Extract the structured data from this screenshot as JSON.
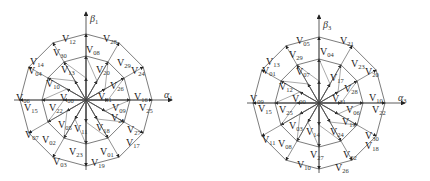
{
  "figure": {
    "panels": [
      {
        "id": "alpha1-beta1",
        "axes": {
          "x_label": "α",
          "x_sub": "1",
          "y_label": "β",
          "y_sub": "1"
        },
        "center": [
          86,
          100
        ],
        "ring_radii": [
          22,
          44,
          66
        ],
        "vectors": [
          {
            "name": "V",
            "sub": "12",
            "x": 62,
            "y": 34
          },
          {
            "name": "V",
            "sub": "28",
            "x": 103,
            "y": 34
          },
          {
            "name": "V",
            "sub": "30",
            "x": 53,
            "y": 48
          },
          {
            "name": "V",
            "sub": "08",
            "x": 86,
            "y": 45
          },
          {
            "name": "V",
            "sub": "14",
            "x": 30,
            "y": 57
          },
          {
            "name": "V",
            "sub": "29",
            "x": 117,
            "y": 58
          },
          {
            "name": "V",
            "sub": "24",
            "x": 131,
            "y": 66
          },
          {
            "name": "V",
            "sub": "04",
            "x": 28,
            "y": 66
          },
          {
            "name": "V",
            "sub": "13",
            "x": 61,
            "y": 65
          },
          {
            "name": "V",
            "sub": "20",
            "x": 96,
            "y": 65
          },
          {
            "name": "V",
            "sub": "10",
            "x": 46,
            "y": 79
          },
          {
            "name": "V",
            "sub": "26",
            "x": 110,
            "y": 81
          },
          {
            "name": "V",
            "sub": "06",
            "x": 16,
            "y": 93
          },
          {
            "name": "V",
            "sub": "00",
            "x": 60,
            "y": 93
          },
          {
            "name": "V",
            "sub": "31",
            "x": 98,
            "y": 92
          },
          {
            "name": "V",
            "sub": "16",
            "x": 134,
            "y": 92
          },
          {
            "name": "V",
            "sub": "15",
            "x": 24,
            "y": 103
          },
          {
            "name": "V",
            "sub": "22",
            "x": 49,
            "y": 103
          },
          {
            "name": "V",
            "sub": "09",
            "x": 112,
            "y": 103
          },
          {
            "name": "V",
            "sub": "25",
            "x": 139,
            "y": 103
          },
          {
            "name": "V",
            "sub": "21",
            "x": 111,
            "y": 113
          },
          {
            "name": "V",
            "sub": "05",
            "x": 58,
            "y": 120
          },
          {
            "name": "V",
            "sub": "11",
            "x": 74,
            "y": 124
          },
          {
            "name": "V",
            "sub": "18",
            "x": 96,
            "y": 123
          },
          {
            "name": "V",
            "sub": "27",
            "x": 127,
            "y": 125
          },
          {
            "name": "V",
            "sub": "07",
            "x": 25,
            "y": 130
          },
          {
            "name": "V",
            "sub": "02",
            "x": 42,
            "y": 135
          },
          {
            "name": "V",
            "sub": "17",
            "x": 126,
            "y": 138
          },
          {
            "name": "V",
            "sub": "23",
            "x": 69,
            "y": 147
          },
          {
            "name": "V",
            "sub": "01",
            "x": 100,
            "y": 147
          },
          {
            "name": "V",
            "sub": "03",
            "x": 53,
            "y": 157
          },
          {
            "name": "V",
            "sub": "19",
            "x": 91,
            "y": 158
          }
        ]
      },
      {
        "id": "alpha3-beta3",
        "axes": {
          "x_label": "α",
          "x_sub": "3",
          "y_label": "β",
          "y_sub": "3"
        },
        "center": [
          104,
          103
        ],
        "ring_radii": [
          22,
          44,
          66
        ],
        "vectors": [
          {
            "name": "V",
            "sub": "05",
            "x": 81,
            "y": 36
          },
          {
            "name": "V",
            "sub": "21",
            "x": 125,
            "y": 36
          },
          {
            "name": "V",
            "sub": "29",
            "x": 74,
            "y": 50
          },
          {
            "name": "V",
            "sub": "04",
            "x": 105,
            "y": 47
          },
          {
            "name": "V",
            "sub": "13",
            "x": 51,
            "y": 57
          },
          {
            "name": "V",
            "sub": "23",
            "x": 136,
            "y": 59
          },
          {
            "name": "V",
            "sub": "20",
            "x": 150,
            "y": 67
          },
          {
            "name": "V",
            "sub": "01",
            "x": 47,
            "y": 66
          },
          {
            "name": "V",
            "sub": "07",
            "x": 81,
            "y": 67
          },
          {
            "name": "V",
            "sub": "17",
            "x": 115,
            "y": 73
          },
          {
            "name": "V",
            "sub": "12",
            "x": 64,
            "y": 82
          },
          {
            "name": "V",
            "sub": "28",
            "x": 129,
            "y": 84
          },
          {
            "name": "V",
            "sub": "09",
            "x": 35,
            "y": 94
          },
          {
            "name": "V",
            "sub": "00",
            "x": 77,
            "y": 94
          },
          {
            "name": "V",
            "sub": "31",
            "x": 117,
            "y": 94
          },
          {
            "name": "V",
            "sub": "10",
            "x": 154,
            "y": 93
          },
          {
            "name": "V",
            "sub": "15",
            "x": 43,
            "y": 104
          },
          {
            "name": "V",
            "sub": "25",
            "x": 64,
            "y": 105
          },
          {
            "name": "V",
            "sub": "06",
            "x": 131,
            "y": 105
          },
          {
            "name": "V",
            "sub": "22",
            "x": 157,
            "y": 105
          },
          {
            "name": "V",
            "sub": "19",
            "x": 127,
            "y": 117
          },
          {
            "name": "V",
            "sub": "03",
            "x": 74,
            "y": 121
          },
          {
            "name": "V",
            "sub": "14",
            "x": 91,
            "y": 127
          },
          {
            "name": "V",
            "sub": "24",
            "x": 115,
            "y": 127
          },
          {
            "name": "V",
            "sub": "11",
            "x": 47,
            "y": 135
          },
          {
            "name": "V",
            "sub": "08",
            "x": 63,
            "y": 139
          },
          {
            "name": "V",
            "sub": "30",
            "x": 150,
            "y": 131
          },
          {
            "name": "V",
            "sub": "18",
            "x": 150,
            "y": 141
          },
          {
            "name": "V",
            "sub": "27",
            "x": 95,
            "y": 150
          },
          {
            "name": "V",
            "sub": "02",
            "x": 128,
            "y": 150
          },
          {
            "name": "V",
            "sub": "10",
            "x": 82,
            "y": 160
          },
          {
            "name": "V",
            "sub": "26",
            "x": 120,
            "y": 163
          }
        ]
      }
    ]
  }
}
